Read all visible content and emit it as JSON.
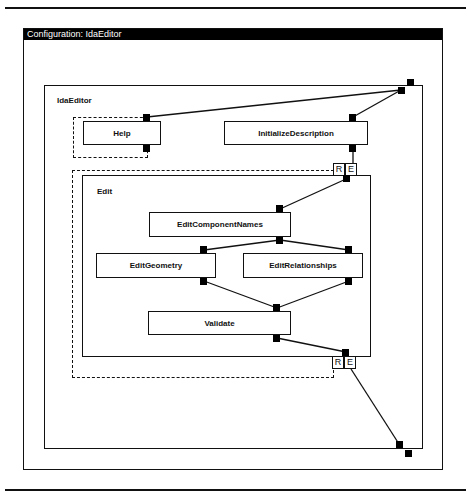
{
  "window": {
    "title": "Configuration: IdaEditor"
  },
  "diagram": {
    "root": {
      "label": "IdaEditor"
    },
    "composite": {
      "label": "Edit"
    },
    "nodes": {
      "help": "Help",
      "initialize_description": "InitializeDescription",
      "edit_component_names": "EditComponentNames",
      "edit_geometry": "EditGeometry",
      "edit_relationships": "EditRelationships",
      "validate": "Validate"
    },
    "re_ports": {
      "top_r": "R",
      "top_e": "E",
      "bottom_r": "R",
      "bottom_e": "E"
    }
  }
}
